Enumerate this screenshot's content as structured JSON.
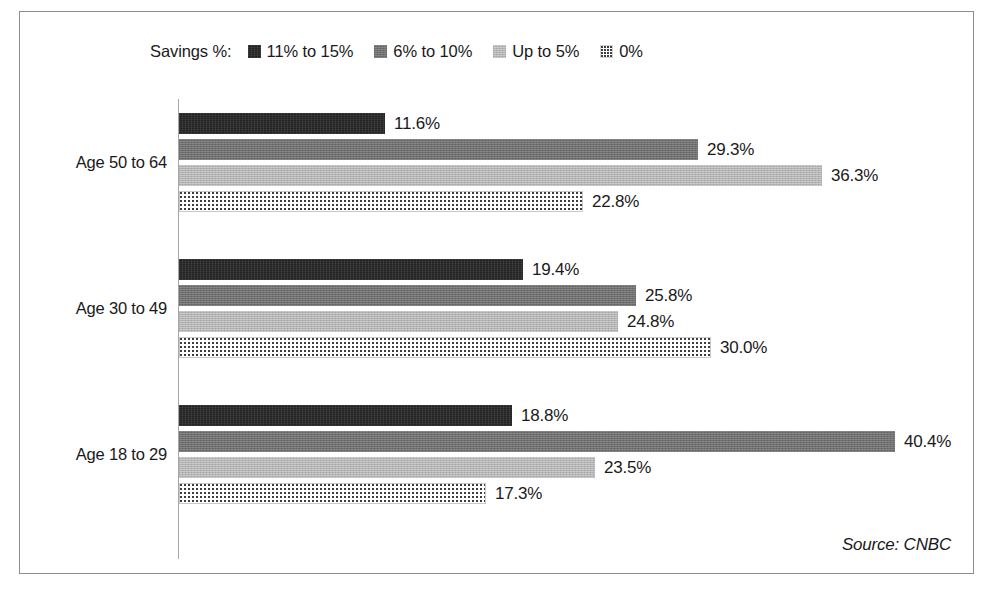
{
  "legend": {
    "title": "Savings %:",
    "items": [
      {
        "label": "11% to 15%",
        "swatch": "dark-swatch-icon"
      },
      {
        "label": "6% to 10%",
        "swatch": "medium-grey-swatch-icon"
      },
      {
        "label": "Up to 5%",
        "swatch": "light-grey-swatch-icon"
      },
      {
        "label": "0%",
        "swatch": "dotted-swatch-icon"
      }
    ]
  },
  "source": "Source: CNBC",
  "chart_data": {
    "type": "bar",
    "orientation": "horizontal",
    "title": "",
    "xlabel": "",
    "ylabel": "",
    "legend_title": "Savings %:",
    "legend_position": "top-left",
    "grid": false,
    "axis_line": true,
    "xlim": [
      0,
      45
    ],
    "categories": [
      "Age 50 to 64",
      "Age 30 to 49",
      "Age 18 to 29"
    ],
    "series": [
      {
        "name": "11% to 15%",
        "color": "#232323",
        "values": [
          11.6,
          19.4,
          18.8
        ]
      },
      {
        "name": "6% to 10%",
        "color": "#6f6f6f",
        "values": [
          29.3,
          25.8,
          40.4
        ]
      },
      {
        "name": "Up to 5%",
        "color": "#b4b4b4",
        "values": [
          36.3,
          24.8,
          23.5
        ]
      },
      {
        "name": "0%",
        "color": "#ffffff",
        "values": [
          22.8,
          30.0,
          17.3
        ]
      }
    ],
    "data_labels": [
      [
        "11.6%",
        "29.3%",
        "36.3%",
        "22.8%"
      ],
      [
        "19.4%",
        "25.8%",
        "24.8%",
        "30.0%"
      ],
      [
        "18.8%",
        "40.4%",
        "23.5%",
        "17.3%"
      ]
    ],
    "annotations": [
      "Source: CNBC"
    ]
  }
}
